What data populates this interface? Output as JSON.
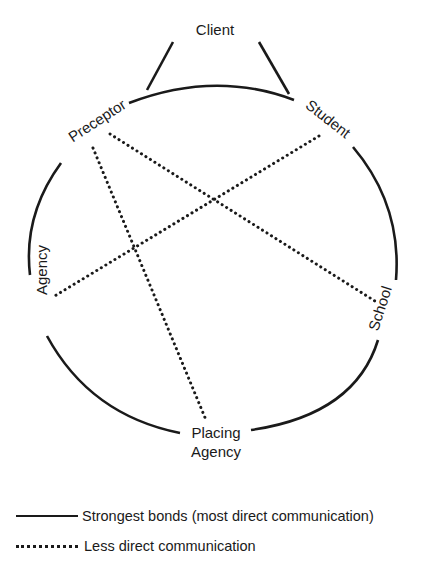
{
  "diagram": {
    "nodes": {
      "client": "Client",
      "preceptor": "Preceptor",
      "student": "Student",
      "agency": "Agency",
      "school": "School",
      "placing_agency_line1": "Placing",
      "placing_agency_line2": "Agency"
    },
    "solid_edges": [
      [
        "Client",
        "Preceptor"
      ],
      [
        "Client",
        "Student"
      ],
      [
        "Preceptor",
        "Student"
      ],
      [
        "Student",
        "School"
      ],
      [
        "School",
        "Placing Agency"
      ],
      [
        "Placing Agency",
        "Agency"
      ],
      [
        "Agency",
        "Preceptor"
      ]
    ],
    "dotted_edges": [
      [
        "Preceptor",
        "School"
      ],
      [
        "Preceptor",
        "Placing Agency"
      ],
      [
        "Student",
        "Agency"
      ]
    ]
  },
  "legend": {
    "solid_label": "Strongest bonds (most direct communication)",
    "dotted_label": "Less direct communication"
  }
}
